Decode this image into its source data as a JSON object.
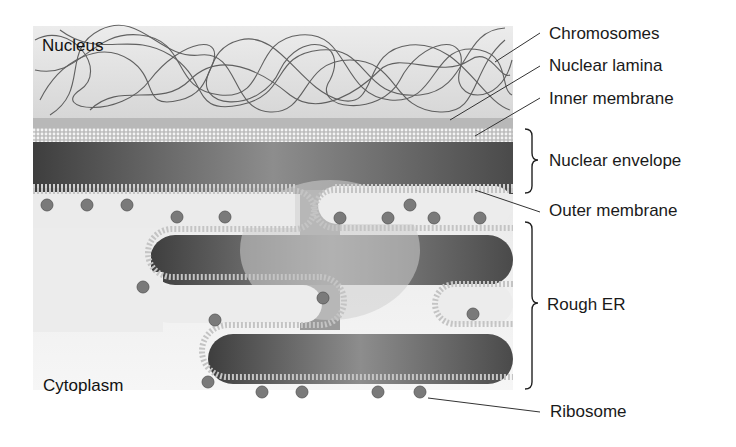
{
  "diagram": {
    "regions": {
      "nucleus": "Nucleus",
      "cytoplasm": "Cytoplasm"
    },
    "labels": [
      {
        "id": "chromosomes",
        "text": "Chromosomes"
      },
      {
        "id": "nuclear-lamina",
        "text": "Nuclear lamina"
      },
      {
        "id": "inner-membrane",
        "text": "Inner membrane"
      },
      {
        "id": "nuclear-envelope",
        "text": "Nuclear envelope"
      },
      {
        "id": "outer-membrane",
        "text": "Outer membrane"
      },
      {
        "id": "rough-er",
        "text": "Rough ER"
      },
      {
        "id": "ribosome",
        "text": "Ribosome"
      }
    ],
    "colors": {
      "nucleoplasm": "#e4e4e4",
      "chromatin": "#4a4a4a",
      "lumen_dark": "#3f3f3f",
      "lumen_light": "#d8d8d8",
      "membrane": "#cfcfcf",
      "cytoplasm": "#f0f0f0",
      "ribosome": "#7a7a7a"
    }
  }
}
